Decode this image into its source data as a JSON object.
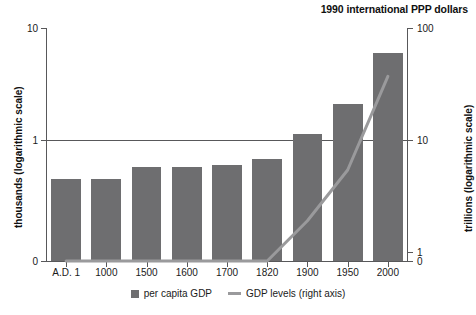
{
  "chart_data": {
    "type": "bar",
    "title": "1990 international PPP dollars",
    "xlabel": "",
    "ylabel": "thousands (logarithmic scale)",
    "y2label": "trillions (logarithmic scale)",
    "grid": true,
    "legend_position": "bottom",
    "categories": [
      "A.D. 1",
      "1000",
      "1500",
      "1600",
      "1700",
      "1820",
      "1900",
      "1950",
      "2000"
    ],
    "yticks": [
      "10",
      "1",
      "0"
    ],
    "ytick_values": [
      10,
      1,
      0
    ],
    "y2ticks": [
      "100",
      "10",
      "1",
      "0"
    ],
    "y2tick_values": [
      100,
      10,
      1,
      0
    ],
    "ylim": [
      0,
      10
    ],
    "y2lim": [
      0,
      100
    ],
    "series": [
      {
        "name": "per capita GDP",
        "axis": "left",
        "type": "bar",
        "color": "#6e6e70",
        "values": [
          0.45,
          0.45,
          0.57,
          0.58,
          0.6,
          0.67,
          1.13,
          2.1,
          6.0
        ]
      },
      {
        "name": "GDP levels (right axis)",
        "axis": "right",
        "type": "line",
        "color": "#9a9a9c",
        "values": [
          0.1,
          0.12,
          0.25,
          0.33,
          0.43,
          0.7,
          1.9,
          5.4,
          37.0
        ]
      }
    ],
    "legend": [
      {
        "label": "per capita GDP",
        "marker": "square",
        "color": "#6e6e70"
      },
      {
        "label": "GDP levels (right axis)",
        "marker": "line",
        "color": "#9a9a9c"
      }
    ]
  },
  "colors": {
    "bar": "#6e6e70",
    "line": "#9a9a9c",
    "axis": "#58585a",
    "text": "#1a1a1a",
    "background": "#ffffff"
  }
}
